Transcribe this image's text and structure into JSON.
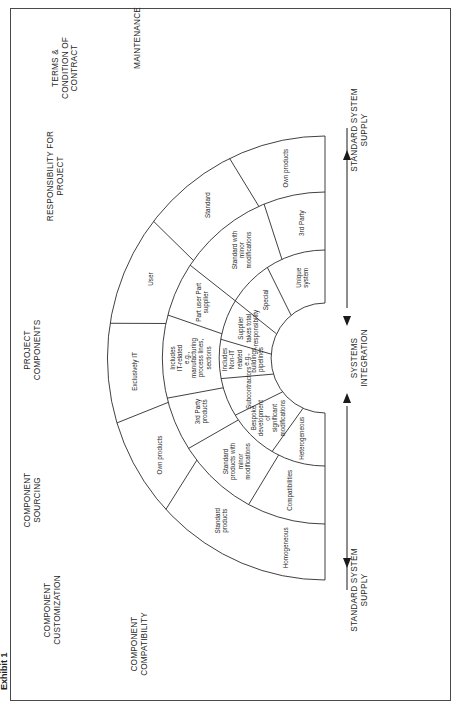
{
  "exhibit_label": "Exhibit 1",
  "diagram": {
    "center": {
      "x": 325,
      "y": 358
    },
    "radii": {
      "outer": 222,
      "ring2": 166,
      "ring3": 108,
      "inner": 55
    },
    "line_color": "#2b2b2b",
    "sectors": [
      {
        "dimension": "MAINTENANCE",
        "rings": [
          {
            "ring": "outer",
            "text": "Own products"
          },
          {
            "ring": "middle",
            "text": "3rd Party"
          },
          {
            "ring": "inner",
            "text": "Unique system"
          }
        ]
      },
      {
        "dimension": "TERMS & CONDITION OF CONTRACT",
        "rings": [
          {
            "ring": "outer",
            "text": "Standard"
          },
          {
            "ring": "middle",
            "text": "Standard with minor modifications"
          },
          {
            "ring": "inner",
            "text": "Special"
          }
        ]
      },
      {
        "dimension": "RESPONSIBILITY FOR PROJECT",
        "rings": [
          {
            "ring": "outer",
            "text": "User"
          },
          {
            "ring": "middle",
            "text": "Part user Part supplier"
          },
          {
            "ring": "inner",
            "text": "Supplier takes total responsibility"
          }
        ]
      },
      {
        "dimension": "PROJECT COMPONENTS",
        "rings": [
          {
            "ring": "outer",
            "text": "Exclusively IT"
          },
          {
            "ring": "middle",
            "text": "Includes IT-related e.g., manufacturing process lines, sections"
          },
          {
            "ring": "inner",
            "text": "Includes Non-IT related e.g., buildings, pipelines"
          }
        ]
      },
      {
        "dimension": "COMPONENT SOURCING",
        "rings": [
          {
            "ring": "outer",
            "text": "Own products"
          },
          {
            "ring": "middle",
            "text": "3rd Party products"
          },
          {
            "ring": "inner",
            "text": "Subcontractors"
          }
        ]
      },
      {
        "dimension": "COMPONENT CUSTOMIZATION",
        "rings": [
          {
            "ring": "outer",
            "text": "Standard products"
          },
          {
            "ring": "middle",
            "text": "Standard products with minor modifications"
          },
          {
            "ring": "inner",
            "text": "Bespoke development of significant modifications"
          }
        ]
      },
      {
        "dimension": "COMPONENT COMPATIBILITY",
        "rings": [
          {
            "ring": "outer",
            "text": "Homogeneous"
          },
          {
            "ring": "middle",
            "text": "Compatibilities"
          },
          {
            "ring": "inner",
            "text": "Heterogeneous"
          }
        ]
      }
    ],
    "axis": {
      "top_end": "STANDARD SYSTEM SUPPLY",
      "center": "SYSTEMS INTEGRATION",
      "bottom_end": "STANDARD SYSTEM SUPPLY"
    }
  }
}
